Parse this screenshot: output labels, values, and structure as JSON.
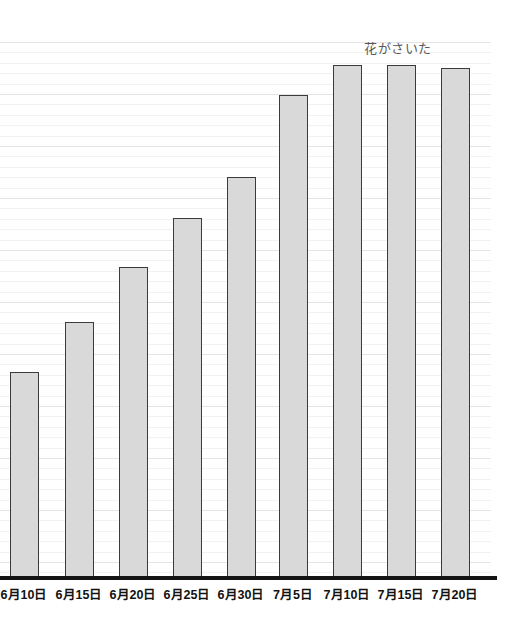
{
  "chart_data": {
    "type": "bar",
    "title": "",
    "subtitle": "",
    "xlabel": "",
    "ylabel": "",
    "grid": true,
    "grid_orientation": "horizontal",
    "legend": "none",
    "categories": [
      "6月10日",
      "6月15日",
      "6月20日",
      "6月25日",
      "6月30日",
      "7月5日",
      "7月10日",
      "7月15日",
      "7月20日"
    ],
    "values": [
      39,
      48,
      58,
      67,
      75,
      90,
      96,
      96,
      95
    ],
    "ylim": [
      0,
      100
    ],
    "series": [
      {
        "name": "草たけ",
        "values": [
          39,
          48,
          58,
          67,
          75,
          90,
          96,
          96,
          95
        ]
      }
    ],
    "annotations": [
      {
        "text": "花がさいた",
        "near_category": "7月10日",
        "position": "above-bar"
      }
    ],
    "bar_fill_color": "#d9d9d9",
    "bar_border_color": "#3b3b3b",
    "axis_color": "#141414",
    "gridline_color": "#f2f2f2"
  },
  "chart": {
    "annotation_label": "花がさいた",
    "bars": [
      {
        "label": "6月10日",
        "value": 39,
        "left": 10,
        "width": 29,
        "top": 372,
        "label_center": 24
      },
      {
        "label": "6月15日",
        "value": 48,
        "left": 65,
        "width": 29,
        "top": 322,
        "label_center": 79
      },
      {
        "label": "6月20日",
        "value": 58,
        "left": 119,
        "width": 29,
        "top": 267,
        "label_center": 133
      },
      {
        "label": "6月25日",
        "value": 67,
        "left": 173,
        "width": 29,
        "top": 218,
        "label_center": 187
      },
      {
        "label": "6月30日",
        "value": 75,
        "left": 227,
        "width": 29,
        "top": 177,
        "label_center": 241
      },
      {
        "label": "7月5日",
        "value": 90,
        "left": 279,
        "width": 29,
        "top": 95,
        "label_center": 293
      },
      {
        "label": "7月10日",
        "value": 96,
        "left": 333,
        "width": 29,
        "top": 65,
        "label_center": 347
      },
      {
        "label": "7月15日",
        "value": 96,
        "left": 387,
        "width": 29,
        "top": 65,
        "label_center": 401
      },
      {
        "label": "7月20日",
        "value": 95,
        "left": 441,
        "width": 29,
        "top": 68,
        "label_center": 455
      }
    ]
  }
}
